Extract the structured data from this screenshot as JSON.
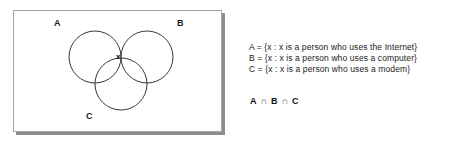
{
  "diagram": {
    "type": "venn-3-set",
    "labels": {
      "a": "A",
      "b": "B",
      "c": "C"
    },
    "element_marker": "x",
    "circles": [
      {
        "set": "A",
        "cx": 81,
        "cy": 46,
        "r": 26
      },
      {
        "set": "B",
        "cx": 133,
        "cy": 46,
        "r": 26
      },
      {
        "set": "C",
        "cx": 107,
        "cy": 73,
        "r": 26
      }
    ],
    "shaded_region": "A ∩ B ∩ C"
  },
  "definitions": [
    "A = {x : x is a person who uses the Internet}",
    "B = {x : x is a person who uses a computer}",
    "C = {x : x is a person who uses a modem}"
  ],
  "expression": {
    "terms": [
      "A",
      "B",
      "C"
    ],
    "operator": "∩",
    "full": "A ∩ B ∩ C"
  },
  "colors": {
    "stroke": "#3a3a3a",
    "panel_border": "#a8a8a8",
    "shadow": "#8d8d8d",
    "text": "#1a1a1a",
    "background": "#ffffff"
  }
}
